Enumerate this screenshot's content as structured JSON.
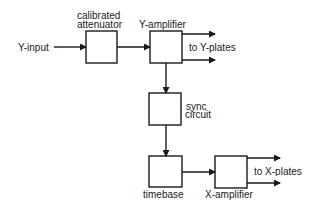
{
  "diagram": {
    "colors": {
      "line": "#1a1a1a",
      "background": "#ffffff"
    },
    "blocks": [
      {
        "id": "attenuator",
        "label_line1": "calibrated",
        "label_line2": "attenuator"
      },
      {
        "id": "y_amplifier",
        "label": "Y-amplifier"
      },
      {
        "id": "sync",
        "label_line1": "sync",
        "label_line2": "circuit"
      },
      {
        "id": "timebase",
        "label": "timebase"
      },
      {
        "id": "x_amplifier",
        "label": "X-amplifier"
      }
    ],
    "input_label": "Y-input",
    "y_output_label": "to Y-plates",
    "x_output_label": "to X-plates",
    "connections": [
      [
        "Y-input",
        "attenuator"
      ],
      [
        "attenuator",
        "y_amplifier"
      ],
      [
        "y_amplifier",
        "to Y-plates"
      ],
      [
        "y_amplifier",
        "sync"
      ],
      [
        "sync",
        "timebase"
      ],
      [
        "timebase",
        "x_amplifier"
      ],
      [
        "x_amplifier",
        "to X-plates"
      ]
    ]
  }
}
